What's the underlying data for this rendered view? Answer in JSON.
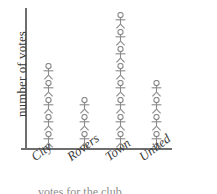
{
  "chart_data": {
    "type": "bar",
    "subtype": "pictogram",
    "title": "",
    "xlabel": "",
    "ylabel": "number of votes",
    "categories": [
      "City",
      "Rovers",
      "Town",
      "United"
    ],
    "values": [
      5,
      3,
      8,
      4
    ],
    "series": [
      {
        "name": "number of votes",
        "values": [
          5,
          3,
          8,
          4
        ]
      }
    ],
    "ylim": [
      0,
      9
    ],
    "grid": false,
    "legend": false,
    "icon_unit_value": 1,
    "icon_name": "person-icon",
    "axis_color": "#6e6e6e",
    "icon_color": "#8a8a8a",
    "text_color": "#3b3b3b",
    "background_color": "#ffffff"
  },
  "axes": {
    "y_title": "number of votes",
    "x_tick_labels": [
      "City",
      "Rovers",
      "Town",
      "United"
    ]
  },
  "caption": {
    "clipped_text": "votes for the club"
  }
}
